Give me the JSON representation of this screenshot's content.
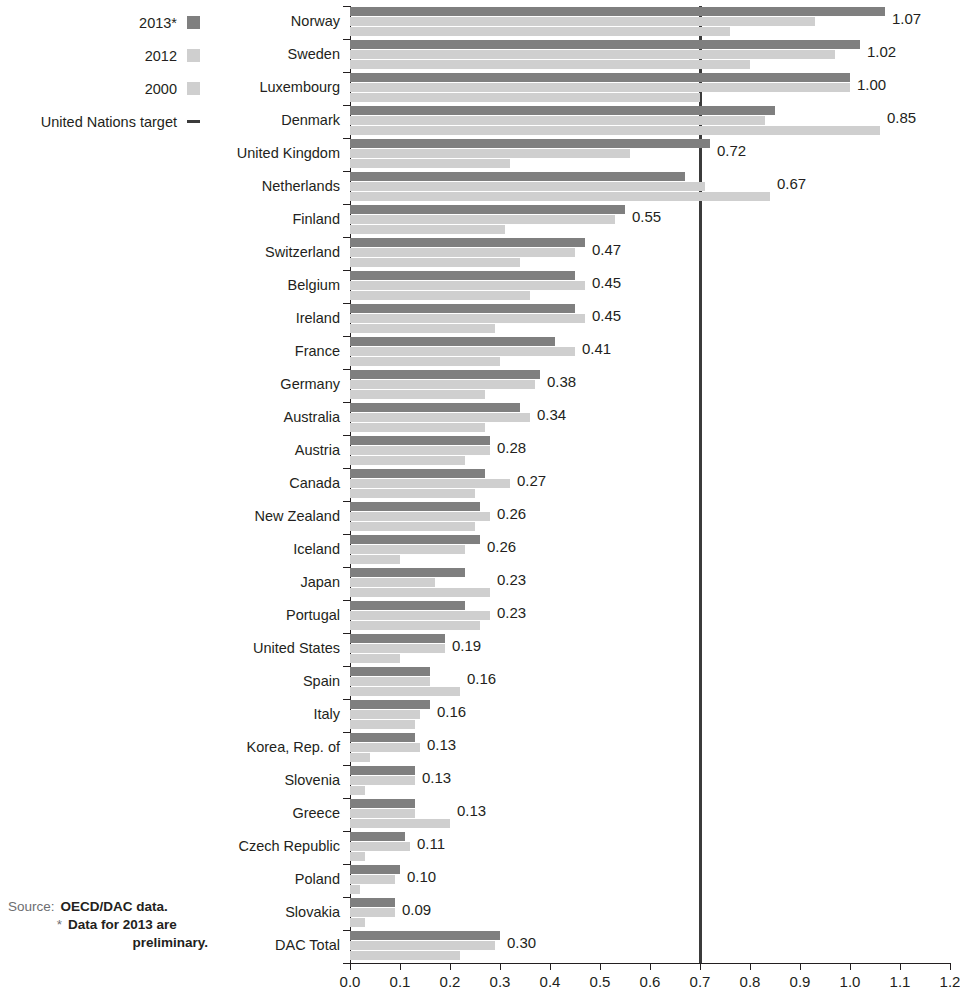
{
  "legend": {
    "items": [
      {
        "label": "2013*",
        "type": "swatch",
        "color": "#7f7f7f",
        "icon": "legend-swatch-2013"
      },
      {
        "label": "2012",
        "type": "swatch",
        "color": "#cfcfcf",
        "icon": "legend-swatch-2012"
      },
      {
        "label": "2000",
        "type": "swatch",
        "color": "#cfcfcf",
        "icon": "legend-swatch-2000"
      },
      {
        "label": "United Nations target",
        "type": "line",
        "color": "#3b3b3b",
        "icon": "legend-line-un-target"
      }
    ]
  },
  "source": {
    "label": "Source:",
    "value": "OECD/DAC data.",
    "note_marker": "*",
    "note_line1": "Data for 2013 are",
    "note_line2": "preliminary."
  },
  "chart_data": {
    "type": "bar",
    "orientation": "horizontal",
    "title": "",
    "xlabel": "",
    "ylabel": "",
    "xlim": [
      0.0,
      1.2
    ],
    "xticks": [
      "0.0",
      "0.1",
      "0.2",
      "0.3",
      "0.4",
      "0.5",
      "0.6",
      "0.7",
      "0.8",
      "0.9",
      "1.0",
      "1.1",
      "1.2"
    ],
    "xtick_values": [
      0.0,
      0.1,
      0.2,
      0.3,
      0.4,
      0.5,
      0.6,
      0.7,
      0.8,
      0.9,
      1.0,
      1.1,
      1.2
    ],
    "grid": false,
    "legend_position": "top-left",
    "reference_line": {
      "label": "United Nations target",
      "value": 0.7,
      "color": "#3b3b3b"
    },
    "categories": [
      "Norway",
      "Sweden",
      "Luxembourg",
      "Denmark",
      "United Kingdom",
      "Netherlands",
      "Finland",
      "Switzerland",
      "Belgium",
      "Ireland",
      "France",
      "Germany",
      "Australia",
      "Austria",
      "Canada",
      "New Zealand",
      "Iceland",
      "Japan",
      "Portugal",
      "United States",
      "Spain",
      "Italy",
      "Korea, Rep. of",
      "Slovenia",
      "Greece",
      "Czech Republic",
      "Poland",
      "Slovakia",
      "DAC Total"
    ],
    "series": [
      {
        "name": "2013*",
        "color": "#7f7f7f",
        "values": [
          1.07,
          1.02,
          1.0,
          0.85,
          0.72,
          0.67,
          0.55,
          0.47,
          0.45,
          0.45,
          0.41,
          0.38,
          0.34,
          0.28,
          0.27,
          0.26,
          0.26,
          0.23,
          0.23,
          0.19,
          0.16,
          0.16,
          0.13,
          0.13,
          0.13,
          0.11,
          0.1,
          0.09,
          0.3
        ],
        "labels": [
          "1.07",
          "1.02",
          "1.00",
          "0.85",
          "0.72",
          "0.67",
          "0.55",
          "0.47",
          "0.45",
          "0.45",
          "0.41",
          "0.38",
          "0.34",
          "0.28",
          "0.27",
          "0.26",
          "0.26",
          "0.23",
          "0.23",
          "0.19",
          "0.16",
          "0.16",
          "0.13",
          "0.13",
          "0.13",
          "0.11",
          "0.10",
          "0.09",
          "0.30"
        ]
      },
      {
        "name": "2012",
        "color": "#cfcfcf",
        "values": [
          0.93,
          0.97,
          1.0,
          0.83,
          0.56,
          0.71,
          0.53,
          0.45,
          0.47,
          0.47,
          0.45,
          0.37,
          0.36,
          0.28,
          0.32,
          0.28,
          0.23,
          0.17,
          0.28,
          0.19,
          0.16,
          0.14,
          0.14,
          0.13,
          0.13,
          0.12,
          0.09,
          0.09,
          0.29
        ]
      },
      {
        "name": "2000",
        "color": "#cfcfcf",
        "values": [
          0.76,
          0.8,
          0.7,
          1.06,
          0.32,
          0.84,
          0.31,
          0.34,
          0.36,
          0.29,
          0.3,
          0.27,
          0.27,
          0.23,
          0.25,
          0.25,
          0.1,
          0.28,
          0.26,
          0.1,
          0.22,
          0.13,
          0.04,
          0.03,
          0.2,
          0.03,
          0.02,
          0.03,
          0.22
        ]
      }
    ]
  }
}
